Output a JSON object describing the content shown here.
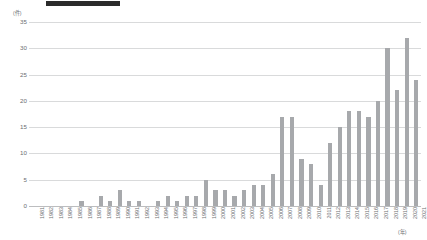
{
  "title": {
    "redacted_bar_label": "title-redacted"
  },
  "axes": {
    "y_unit": "(件)",
    "x_unit": "(年)",
    "y_ticks": [
      0,
      5,
      10,
      15,
      20,
      25,
      30,
      35
    ]
  },
  "chart_data": {
    "type": "bar",
    "title": "",
    "subtitle": "",
    "xlabel": "(年)",
    "ylabel": "(件)",
    "ylim": [
      0,
      35
    ],
    "grid": true,
    "legend": "none",
    "bar_color": "#a7a9ac",
    "categories": [
      "1981",
      "1982",
      "1983",
      "1984",
      "1985",
      "1986",
      "1987",
      "1988",
      "1989",
      "1990",
      "1991",
      "1992",
      "1993",
      "1994",
      "1995",
      "1996",
      "1997",
      "1998",
      "1999",
      "2000",
      "2001",
      "2002",
      "2003",
      "2004",
      "2005",
      "2006",
      "2007",
      "2008",
      "2009",
      "2010",
      "2011",
      "2012",
      "2013",
      "2014",
      "2015",
      "2016",
      "2017",
      "2018",
      "2019",
      "2020",
      "2021"
    ],
    "values": [
      0,
      0,
      0,
      0,
      0,
      1,
      0,
      2,
      1,
      3,
      1,
      1,
      0,
      1,
      2,
      1,
      2,
      2,
      5,
      3,
      3,
      2,
      3,
      4,
      4,
      6,
      17,
      17,
      9,
      8,
      4,
      12,
      15,
      18,
      18,
      17,
      20,
      30,
      22,
      32,
      24
    ]
  }
}
